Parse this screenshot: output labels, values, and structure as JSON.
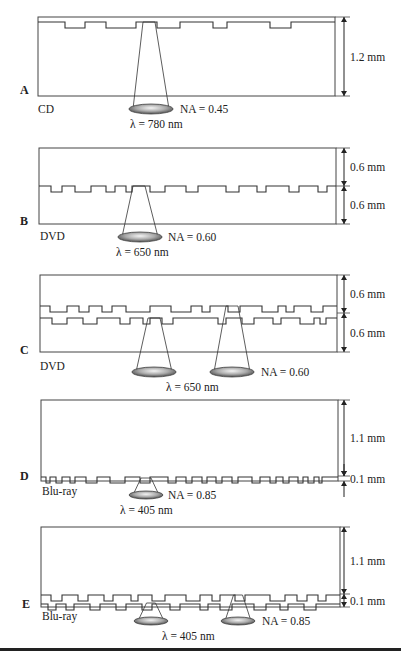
{
  "figure": {
    "panels": [
      {
        "id": "A",
        "format": "CD",
        "y_top": 17,
        "y_bottom": 96,
        "frame_x": [
          38,
          335
        ],
        "layers": [
          {
            "y": 22,
            "pit_depth": 6,
            "pits": [
              [
                65,
                85
              ],
              [
                106,
                136
              ],
              [
                157,
                180
              ],
              [
                213,
                227
              ],
              [
                270,
                291
              ]
            ]
          }
        ],
        "top_line": 17,
        "dimensions": [
          {
            "label": "1.2 mm",
            "y1": 17,
            "y2": 96
          }
        ],
        "lenses": [
          {
            "cx": 151,
            "cy": 109,
            "rx": 22,
            "ry": 5,
            "focus_x": 149,
            "focus_y": 22,
            "spot_w": 12
          }
        ],
        "na": "NA = 0.45",
        "na_pos": [
          180,
          113
        ],
        "wavelength": "λ = 780 nm",
        "wl_pos": [
          130,
          128
        ],
        "letter_pos": [
          20,
          94
        ],
        "format_pos": [
          38,
          113
        ]
      },
      {
        "id": "B",
        "format": "DVD",
        "y_top": 148,
        "y_bottom": 224,
        "frame_x": [
          39,
          336
        ],
        "layers": [
          {
            "y": 186,
            "pit_depth": 6,
            "pits": [
              [
                51,
                62
              ],
              [
                75,
                91
              ],
              [
                106,
                115
              ],
              [
                126,
                132
              ],
              [
                150,
                165
              ],
              [
                186,
                198
              ],
              [
                226,
                239
              ],
              [
                257,
                266
              ],
              [
                289,
                299
              ],
              [
                318,
                327
              ]
            ]
          }
        ],
        "dimensions": [
          {
            "label": "0.6 mm",
            "y1": 148,
            "y2": 186
          },
          {
            "label": "0.6 mm",
            "y1": 186,
            "y2": 224
          }
        ],
        "lenses": [
          {
            "cx": 140,
            "cy": 237,
            "rx": 22,
            "ry": 5,
            "focus_x": 139,
            "focus_y": 186,
            "spot_w": 12
          }
        ],
        "na": "NA = 0.60",
        "na_pos": [
          168,
          241
        ],
        "wavelength": "λ = 650 nm",
        "wl_pos": [
          116,
          256
        ],
        "letter_pos": [
          20,
          225
        ],
        "format_pos": [
          40,
          240
        ]
      },
      {
        "id": "C",
        "format": "DVD",
        "y_top": 275,
        "y_bottom": 352,
        "frame_x": [
          40,
          337
        ],
        "layers": [
          {
            "y": 306,
            "pit_depth": 6,
            "pits": [
              [
                50,
                67
              ],
              [
                79,
                89
              ],
              [
                102,
                112
              ],
              [
                126,
                150
              ],
              [
                171,
                191
              ],
              [
                202,
                210
              ],
              [
                228,
                240
              ],
              [
                262,
                278
              ],
              [
                286,
                294
              ],
              [
                311,
                323
              ]
            ]
          },
          {
            "y": 318,
            "pit_depth": 6,
            "pits": [
              [
                52,
                67
              ],
              [
                83,
                97
              ],
              [
                120,
                130
              ],
              [
                143,
                150
              ],
              [
                162,
                173
              ],
              [
                218,
                226
              ],
              [
                242,
                254
              ],
              [
                273,
                281
              ],
              [
                300,
                314
              ],
              [
                320,
                326
              ]
            ]
          }
        ],
        "dimensions": [
          {
            "label": "0.6 mm",
            "y1": 275,
            "y2": 313
          },
          {
            "label": "0.6 mm",
            "y1": 313,
            "y2": 352
          }
        ],
        "lenses": [
          {
            "cx": 154,
            "cy": 372,
            "rx": 22,
            "ry": 5,
            "focus_x": 154,
            "focus_y": 318,
            "spot_w": 12
          },
          {
            "cx": 232,
            "cy": 372,
            "rx": 22,
            "ry": 5,
            "focus_x": 232,
            "focus_y": 306,
            "spot_w": 12
          }
        ],
        "na": "NA = 0.60",
        "na_pos": [
          261,
          376
        ],
        "wavelength": "λ = 650 nm",
        "wl_pos": [
          166,
          391
        ],
        "letter_pos": [
          20,
          354
        ],
        "format_pos": [
          40,
          370
        ]
      },
      {
        "id": "D",
        "format": "Blu-ray",
        "y_top": 400,
        "y_bottom": 481,
        "frame_x": [
          41,
          338
        ],
        "layers": [
          {
            "y": 477,
            "pit_depth": 6,
            "pits": [
              [
                46,
                50
              ],
              [
                56,
                62
              ],
              [
                70,
                75
              ],
              [
                86,
                97
              ],
              [
                110,
                125
              ],
              [
                140,
                150
              ],
              [
                168,
                176
              ],
              [
                186,
                192
              ],
              [
                202,
                207
              ],
              [
                216,
                222
              ],
              [
                232,
                238
              ],
              [
                252,
                260
              ],
              [
                270,
                276
              ],
              [
                283,
                289
              ],
              [
                298,
                303
              ],
              [
                308,
                314
              ],
              [
                319,
                322
              ]
            ]
          }
        ],
        "bottom_line": 481,
        "dimensions": [
          {
            "label": "1.1 mm",
            "y1": 400,
            "y2": 476
          },
          {
            "label": "0.1 mm",
            "y1": 476,
            "y2": 481
          }
        ],
        "lenses": [
          {
            "cx": 146,
            "cy": 495,
            "rx": 17,
            "ry": 4,
            "focus_x": 146,
            "focus_y": 478,
            "spot_w": 10
          }
        ],
        "na": "NA = 0.85",
        "na_pos": [
          168,
          499
        ],
        "wavelength": "λ = 405 nm",
        "wl_pos": [
          120,
          514
        ],
        "letter_pos": [
          20,
          480
        ],
        "format_pos": [
          42,
          495
        ]
      },
      {
        "id": "E",
        "format": "Blu-ray",
        "y_top": 527,
        "y_bottom": 607,
        "frame_x": [
          41,
          340
        ],
        "layers": [
          {
            "y": 595,
            "pit_depth": 6,
            "pits": [
              [
                51,
                62
              ],
              [
                78,
                88
              ],
              [
                104,
                113
              ],
              [
                131,
                138
              ],
              [
                152,
                165
              ],
              [
                186,
                200
              ],
              [
                212,
                220
              ],
              [
                235,
                245
              ],
              [
                270,
                285
              ],
              [
                297,
                307
              ],
              [
                318,
                326
              ]
            ]
          },
          {
            "y": 604,
            "pit_depth": 6,
            "pits": [
              [
                48,
                56
              ],
              [
                66,
                74
              ],
              [
                90,
                100
              ],
              [
                116,
                126
              ],
              [
                142,
                152
              ],
              [
                170,
                180
              ],
              [
                200,
                208
              ],
              [
                220,
                232
              ],
              [
                254,
                266
              ],
              [
                280,
                288
              ],
              [
                304,
                316
              ]
            ]
          }
        ],
        "bottom_line": 607,
        "dimensions": [
          {
            "label": "1.1 mm",
            "y1": 527,
            "y2": 594
          },
          {
            "label": "0.1 mm",
            "y1": 594,
            "y2": 607
          }
        ],
        "lenses": [
          {
            "cx": 151,
            "cy": 621,
            "rx": 17,
            "ry": 4,
            "focus_x": 151,
            "focus_y": 603,
            "spot_w": 9
          },
          {
            "cx": 238,
            "cy": 621,
            "rx": 17,
            "ry": 4,
            "focus_x": 238,
            "focus_y": 595,
            "spot_w": 9
          }
        ],
        "na": "NA = 0.85",
        "na_pos": [
          262,
          625
        ],
        "wavelength": "λ = 405 nm",
        "wl_pos": [
          162,
          640
        ],
        "letter_pos": [
          22,
          608
        ],
        "format_pos": [
          42,
          620
        ]
      }
    ],
    "dim_x": 344,
    "dim_label_x": 350,
    "bottom_rule_y": 648
  },
  "colors": {
    "line": "#333333",
    "lens_dark": "#5a5a5a",
    "lens_light": "#e8e8e8",
    "background": "#ffffff"
  }
}
